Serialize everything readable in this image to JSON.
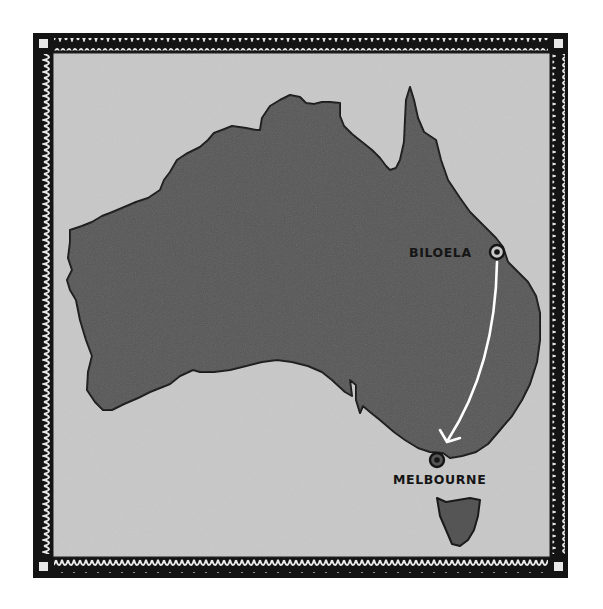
{
  "map": {
    "title": "Australia route map",
    "region": "Australia",
    "colors": {
      "land": "#555555",
      "water": "#c8c8c8",
      "border": "#141414",
      "route": "#ffffff",
      "label": "#151515"
    },
    "locations": [
      {
        "name": "BILOELA",
        "role": "origin"
      },
      {
        "name": "MELBOURNE",
        "role": "destination"
      }
    ],
    "route": {
      "from": "BILOELA",
      "to": "MELBOURNE",
      "arrow": "arrow-icon"
    }
  }
}
